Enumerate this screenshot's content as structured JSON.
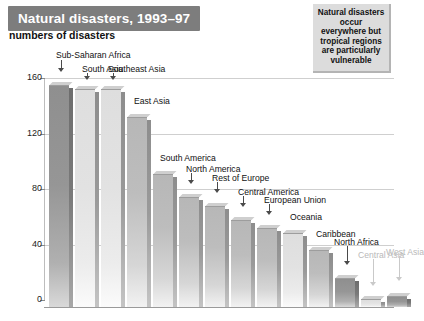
{
  "title": "Natural disasters, 1993–97",
  "subtitle": "numbers of disasters",
  "note": "Natural disasters occur everywhere but tropical regions are particularly vulnerable",
  "colors": {
    "title_banner": "#7d7d7d",
    "title_text": "#ffffff",
    "note_bg": "#dcdcdc",
    "bar_mid": "#bdbdbd",
    "bar_dark": "#969696",
    "bar_light": "#e2e2e2",
    "gridline": "#cfcfcf",
    "axis": "#9a9a9a"
  },
  "chart_data": {
    "type": "bar",
    "title": "Natural disasters, 1993–97",
    "subtitle": "numbers of disasters",
    "xlabel": "",
    "ylabel": "numbers of disasters",
    "ylim": [
      0,
      160
    ],
    "yticks": [
      0,
      40,
      80,
      120,
      160
    ],
    "ytick_labels": [
      "0",
      "40",
      "80",
      "120",
      "160"
    ],
    "grid": true,
    "legend": "none",
    "categories": [
      "Sub-Saharan Africa",
      "South Asia",
      "Southeast Asia",
      "East Asia",
      "South America",
      "North America",
      "Rest of Europe",
      "Central America",
      "European Union",
      "Oceania",
      "Caribbean",
      "North Africa",
      "Central Asia",
      "West Asia"
    ],
    "values": [
      160,
      157,
      157,
      137,
      96,
      79,
      73,
      63,
      57,
      53,
      41,
      21,
      6,
      8
    ],
    "annotations": [
      "Natural disasters occur everywhere but tropical regions are particularly vulnerable"
    ]
  },
  "bars": [
    {
      "label": "Sub-Saharan Africa",
      "value": 160,
      "shade": "dark",
      "x": 5,
      "w": 20,
      "label_x": 12,
      "label_y": -28,
      "arrow_x": 14,
      "arrow_top": -18,
      "arrow_len": 12,
      "faded": false
    },
    {
      "label": "South Asia",
      "value": 157,
      "shade": "light",
      "x": 31,
      "w": 20,
      "label_x": 38,
      "label_y": -18,
      "arrow_x": 40,
      "arrow_top": -9,
      "arrow_len": 7,
      "faded": false
    },
    {
      "label": "Southeast Asia",
      "value": 157,
      "shade": "light",
      "x": 57,
      "w": 20,
      "label_x": 64,
      "label_y": -18,
      "arrow_x": 66,
      "arrow_top": -9,
      "arrow_len": 7,
      "faded": false
    },
    {
      "label": "East Asia",
      "value": 137,
      "shade": "mid",
      "x": 83,
      "w": 20,
      "label_x": 90,
      "label_y": -14,
      "arrow_x": 0,
      "arrow_top": 0,
      "arrow_len": 0,
      "faded": false
    },
    {
      "label": "South America",
      "value": 96,
      "shade": "mid",
      "x": 109,
      "w": 20,
      "label_x": 116,
      "label_y": -14,
      "arrow_x": 0,
      "arrow_top": 0,
      "arrow_len": 0,
      "faded": false
    },
    {
      "label": "North America",
      "value": 79,
      "shade": "mid",
      "x": 135,
      "w": 20,
      "label_x": 142,
      "label_y": -26,
      "arrow_x": 144,
      "arrow_top": -17,
      "arrow_len": 11,
      "faded": false
    },
    {
      "label": "Rest of Europe",
      "value": 73,
      "shade": "mid",
      "x": 161,
      "w": 20,
      "label_x": 168,
      "label_y": -26,
      "arrow_x": 170,
      "arrow_top": -17,
      "arrow_len": 11,
      "faded": false
    },
    {
      "label": "Central America",
      "value": 63,
      "shade": "mid",
      "x": 187,
      "w": 20,
      "label_x": 194,
      "label_y": -26,
      "arrow_x": 196,
      "arrow_top": -17,
      "arrow_len": 11,
      "faded": false
    },
    {
      "label": "European Union",
      "value": 57,
      "shade": "mid",
      "x": 213,
      "w": 20,
      "label_x": 220,
      "label_y": -26,
      "arrow_x": 222,
      "arrow_top": -17,
      "arrow_len": 11,
      "faded": false
    },
    {
      "label": "Oceania",
      "value": 53,
      "shade": "light",
      "x": 239,
      "w": 20,
      "label_x": 246,
      "label_y": -14,
      "arrow_x": 0,
      "arrow_top": 0,
      "arrow_len": 0,
      "faded": false
    },
    {
      "label": "Caribbean",
      "value": 41,
      "shade": "mid",
      "x": 265,
      "w": 20,
      "label_x": 272,
      "label_y": -14,
      "arrow_x": 0,
      "arrow_top": 0,
      "arrow_len": 0,
      "faded": false
    },
    {
      "label": "North Africa",
      "value": 21,
      "shade": "dark",
      "x": 291,
      "w": 20,
      "label_x": 290,
      "label_y": -34,
      "arrow_x": 300,
      "arrow_top": -25,
      "arrow_len": 19,
      "faded": false
    },
    {
      "label": "Central Asia",
      "value": 6,
      "shade": "light",
      "x": 317,
      "w": 20,
      "label_x": 314,
      "label_y": -42,
      "arrow_x": 326,
      "arrow_top": -33,
      "arrow_len": 27,
      "faded": true
    },
    {
      "label": "West Asia",
      "value": 8,
      "shade": "dark",
      "x": 343,
      "w": 20,
      "label_x": 342,
      "label_y": -42,
      "arrow_x": 352,
      "arrow_top": -33,
      "arrow_len": 25,
      "faded": true
    }
  ]
}
